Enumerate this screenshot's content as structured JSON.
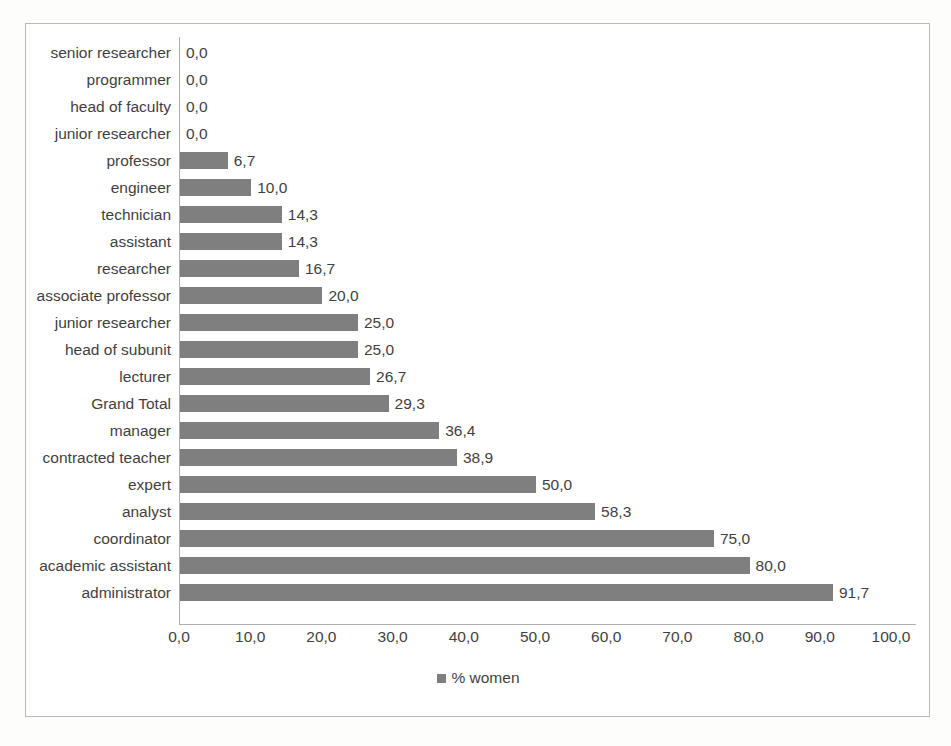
{
  "chart_data": {
    "type": "bar",
    "orientation": "horizontal",
    "title": "",
    "xlabel": "",
    "ylabel": "",
    "xlim": [
      0,
      100
    ],
    "xtick_step": 10,
    "grid": false,
    "decimal_separator": ",",
    "legend_position": "bottom",
    "series": [
      {
        "name": "% women",
        "color": "#7f7f7f",
        "values": [
          0.0,
          0.0,
          0.0,
          0.0,
          6.7,
          10.0,
          14.3,
          14.3,
          16.7,
          20.0,
          25.0,
          25.0,
          26.7,
          29.3,
          36.4,
          38.9,
          50.0,
          58.3,
          75.0,
          80.0,
          91.7
        ]
      }
    ],
    "categories": [
      "senior researcher",
      "programmer",
      "head of faculty",
      "junior researcher",
      "professor",
      "engineer",
      "technician",
      "assistant",
      "researcher",
      "associate professor",
      "junior researcher",
      "head of subunit",
      "lecturer",
      "Grand Total",
      "manager",
      "contracted teacher",
      "expert",
      "analyst",
      "coordinator",
      "academic assistant",
      "administrator"
    ],
    "data_labels": [
      "0,0",
      "0,0",
      "0,0",
      "0,0",
      "6,7",
      "10,0",
      "14,3",
      "14,3",
      "16,7",
      "20,0",
      "25,0",
      "25,0",
      "26,7",
      "29,3",
      "36,4",
      "38,9",
      "50,0",
      "58,3",
      "75,0",
      "80,0",
      "91,7"
    ],
    "xticks": [
      "0,0",
      "10,0",
      "20,0",
      "30,0",
      "40,0",
      "50,0",
      "60,0",
      "70,0",
      "80,0",
      "90,0",
      "100,0"
    ],
    "xtick_values": [
      0,
      10,
      20,
      30,
      40,
      50,
      60,
      70,
      80,
      90,
      100
    ]
  },
  "legend": {
    "label": "% women",
    "swatch_color": "#7f7f7f"
  },
  "style": {
    "bar_color": "#7f7f7f",
    "axis_color": "#b0b0b0",
    "frame_color": "#b9b9b9",
    "text_color": "#3f3f3f",
    "background": "#ffffff"
  }
}
